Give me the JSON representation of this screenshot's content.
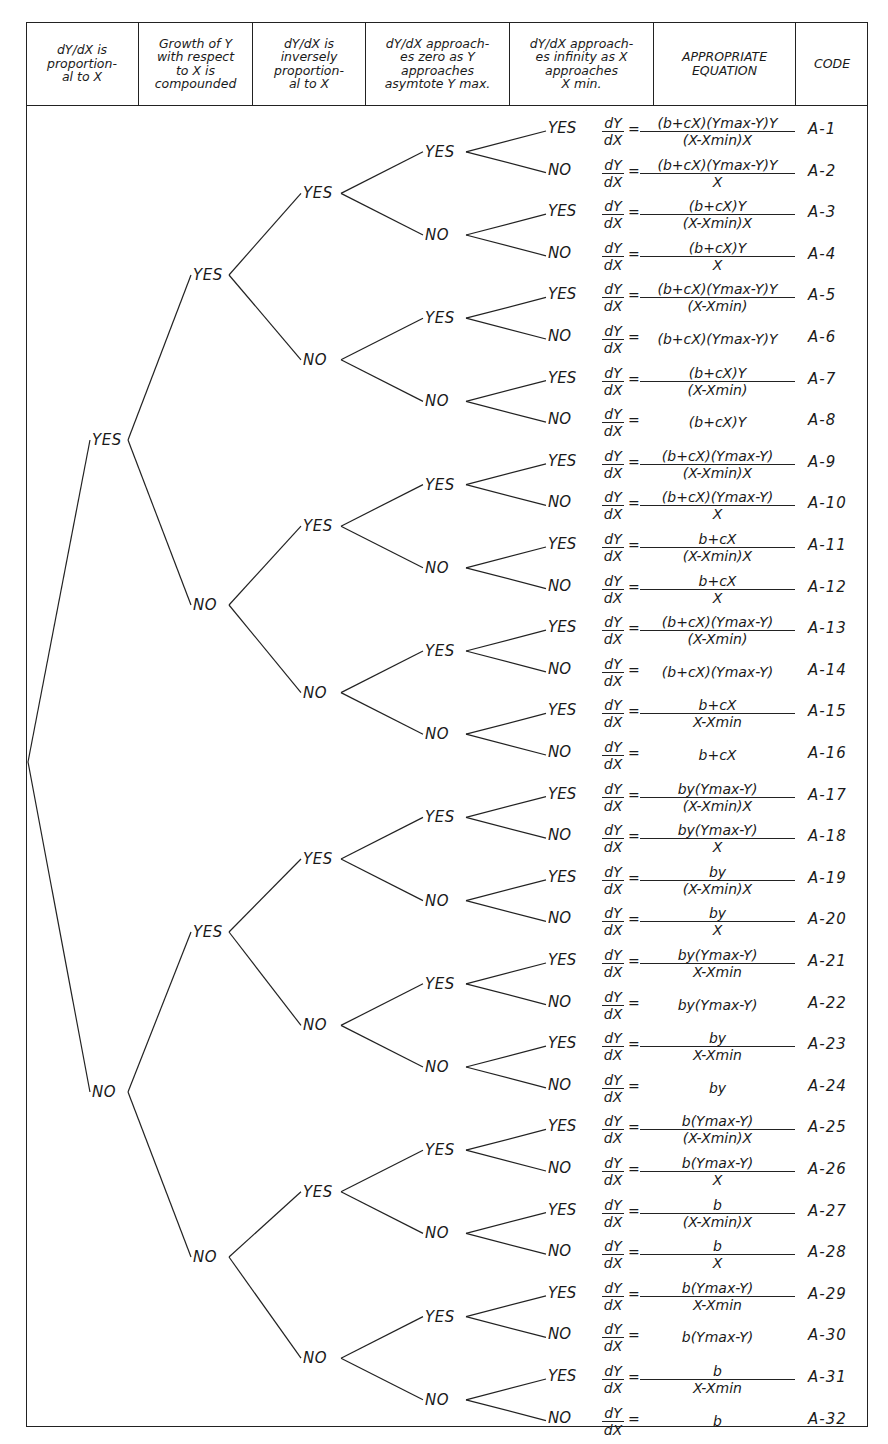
{
  "header": {
    "columns": [
      {
        "label": "dY/dX is\nproportion-\nal to X"
      },
      {
        "label": "Growth of Y\nwith respect\nto X is\ncompounded"
      },
      {
        "label": "dY/dX is\ninversely\nproportion-\nal to X"
      },
      {
        "label": "dY/dX approach-\nes zero as Y\napproaches\nasymtote Y max."
      },
      {
        "label": "dY/dX approach-\nes infinity as X\napproaches\nX min."
      },
      {
        "label": "APPROPRIATE\nEQUATION"
      },
      {
        "label": "CODE"
      }
    ]
  },
  "tree": {
    "level1": [
      {
        "label": "YES"
      },
      {
        "label": "NO"
      }
    ],
    "level2": [
      {
        "label": "YES"
      },
      {
        "label": "NO"
      },
      {
        "label": "YES"
      },
      {
        "label": "NO"
      }
    ],
    "level3": [
      {
        "label": "YES"
      },
      {
        "label": "NO"
      },
      {
        "label": "YES"
      },
      {
        "label": "NO"
      },
      {
        "label": "YES"
      },
      {
        "label": "NO"
      },
      {
        "label": "YES"
      },
      {
        "label": "NO"
      }
    ],
    "level4": [
      {
        "label": "YES"
      },
      {
        "label": "NO"
      },
      {
        "label": "YES"
      },
      {
        "label": "NO"
      },
      {
        "label": "YES"
      },
      {
        "label": "NO"
      },
      {
        "label": "YES"
      },
      {
        "label": "NO"
      },
      {
        "label": "YES"
      },
      {
        "label": "NO"
      },
      {
        "label": "YES"
      },
      {
        "label": "NO"
      },
      {
        "label": "YES"
      },
      {
        "label": "NO"
      },
      {
        "label": "YES"
      },
      {
        "label": "NO"
      }
    ]
  },
  "derivative": {
    "num": "dY",
    "den": "dX",
    "eq": "="
  },
  "rows": [
    {
      "leaf": "YES",
      "num": "(b+cX)(Ymax-Y)Y",
      "den": "(X-Xmin)X",
      "code": "A-1"
    },
    {
      "leaf": "NO",
      "num": "(b+cX)(Ymax-Y)Y",
      "den": "X",
      "code": "A-2"
    },
    {
      "leaf": "YES",
      "num": "(b+cX)Y",
      "den": "(X-Xmin)X",
      "code": "A-3"
    },
    {
      "leaf": "NO",
      "num": "(b+cX)Y",
      "den": "X",
      "code": "A-4"
    },
    {
      "leaf": "YES",
      "num": "(b+cX)(Ymax-Y)Y",
      "den": "(X-Xmin)",
      "code": "A-5"
    },
    {
      "leaf": "NO",
      "num": "(b+cX)(Ymax-Y)Y",
      "den": "",
      "code": "A-6"
    },
    {
      "leaf": "YES",
      "num": "(b+cX)Y",
      "den": "(X-Xmin)",
      "code": "A-7"
    },
    {
      "leaf": "NO",
      "num": "(b+cX)Y",
      "den": "",
      "code": "A-8"
    },
    {
      "leaf": "YES",
      "num": "(b+cX)(Ymax-Y)",
      "den": "(X-Xmin)X",
      "code": "A-9"
    },
    {
      "leaf": "NO",
      "num": "(b+cX)(Ymax-Y)",
      "den": "X",
      "code": "A-10"
    },
    {
      "leaf": "YES",
      "num": "b+cX",
      "den": "(X-Xmin)X",
      "code": "A-11"
    },
    {
      "leaf": "NO",
      "num": "b+cX",
      "den": "X",
      "code": "A-12"
    },
    {
      "leaf": "YES",
      "num": "(b+cX)(Ymax-Y)",
      "den": "(X-Xmin)",
      "code": "A-13"
    },
    {
      "leaf": "NO",
      "num": "(b+cX)(Ymax-Y)",
      "den": "",
      "code": "A-14"
    },
    {
      "leaf": "YES",
      "num": "b+cX",
      "den": "X-Xmin",
      "code": "A-15"
    },
    {
      "leaf": "NO",
      "num": "b+cX",
      "den": "",
      "code": "A-16"
    },
    {
      "leaf": "YES",
      "num": "by(Ymax-Y)",
      "den": "(X-Xmin)X",
      "code": "A-17"
    },
    {
      "leaf": "NO",
      "num": "by(Ymax-Y)",
      "den": "X",
      "code": "A-18"
    },
    {
      "leaf": "YES",
      "num": "by",
      "den": "(X-Xmin)X",
      "code": "A-19"
    },
    {
      "leaf": "NO",
      "num": "by",
      "den": "X",
      "code": "A-20"
    },
    {
      "leaf": "YES",
      "num": "by(Ymax-Y)",
      "den": "X-Xmin",
      "code": "A-21"
    },
    {
      "leaf": "NO",
      "num": "by(Ymax-Y)",
      "den": "",
      "code": "A-22"
    },
    {
      "leaf": "YES",
      "num": "by",
      "den": "X-Xmin",
      "code": "A-23"
    },
    {
      "leaf": "NO",
      "num": "by",
      "den": "",
      "code": "A-24"
    },
    {
      "leaf": "YES",
      "num": "b(Ymax-Y)",
      "den": "(X-Xmin)X",
      "code": "A-25"
    },
    {
      "leaf": "NO",
      "num": "b(Ymax-Y)",
      "den": "X",
      "code": "A-26"
    },
    {
      "leaf": "YES",
      "num": "b",
      "den": "(X-Xmin)X",
      "code": "A-27"
    },
    {
      "leaf": "NO",
      "num": "b",
      "den": "X",
      "code": "A-28"
    },
    {
      "leaf": "YES",
      "num": "b(Ymax-Y)",
      "den": "X-Xmin",
      "code": "A-29"
    },
    {
      "leaf": "NO",
      "num": "b(Ymax-Y)",
      "den": "",
      "code": "A-30"
    },
    {
      "leaf": "YES",
      "num": "b",
      "den": "X-Xmin",
      "code": "A-31"
    },
    {
      "leaf": "NO",
      "num": "b",
      "den": "",
      "code": "A-32"
    }
  ]
}
